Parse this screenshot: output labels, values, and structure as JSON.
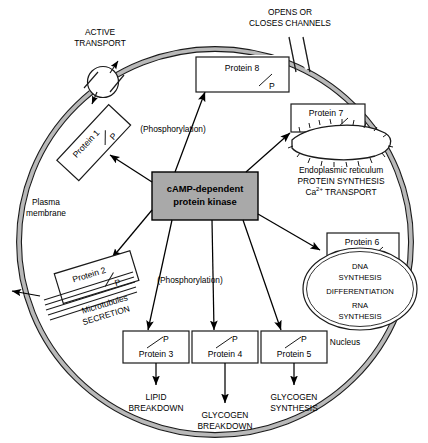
{
  "diagram": {
    "colors": {
      "membrane_fill": "#b9b9b9",
      "membrane_stroke": "#1a1a1a",
      "kinase_fill": "#a9a9a9",
      "kinase_stroke": "#000000",
      "box_fill": "#ffffff",
      "line": "#000000"
    },
    "central": {
      "line1": "cAMP-dependent",
      "line2": "protein  kinase"
    },
    "membrane_label": {
      "line1": "Plasma",
      "line2": "membrane"
    },
    "top_labels": {
      "active_transport_l1": "ACTIVE",
      "active_transport_l2": "TRANSPORT",
      "channels_l1": "OPENS OR",
      "channels_l2": "CLOSES CHANNELS"
    },
    "phosphorylation_upper": "(Phosphorylation)",
    "phosphorylation_lower": "(Phosphorylation)",
    "microtubules": {
      "line1": "Microtubules",
      "line2": "SECRETION"
    },
    "er": {
      "line1": "Endoplasmic reticulum",
      "line2": "PROTEIN SYNTHESIS",
      "line3_pre": "Ca",
      "line3_sup": "2+",
      "line3_post": " TRANSPORT"
    },
    "nucleus": {
      "label": "Nucleus",
      "line1": "DNA",
      "line2": "SYNTHESIS",
      "line3": "DIFFERENTIATION",
      "line4": "RNA",
      "line5": "SYNTHESIS"
    },
    "proteins": [
      {
        "id": "protein-1",
        "label": "Protein 1",
        "phos": "P"
      },
      {
        "id": "protein-2",
        "label": "Protein 2",
        "phos": "P"
      },
      {
        "id": "protein-3",
        "label": "Protein 3",
        "phos": "P"
      },
      {
        "id": "protein-4",
        "label": "Protein 4",
        "phos": "P"
      },
      {
        "id": "protein-5",
        "label": "Protein 5",
        "phos": "P"
      },
      {
        "id": "protein-6",
        "label": "Protein 6",
        "phos": "P"
      },
      {
        "id": "protein-7",
        "label": "Protein 7",
        "phos": "P"
      },
      {
        "id": "protein-8",
        "label": "Protein 8",
        "phos": "P"
      }
    ],
    "outcomes": {
      "lipid_l1": "LIPID",
      "lipid_l2": "BREAKDOWN",
      "glycogen_break_l1": "GLYCOGEN",
      "glycogen_break_l2": "BREAKDOWN",
      "glycogen_syn_l1": "GLYCOGEN",
      "glycogen_syn_l2": "SYNTHESIS"
    }
  }
}
